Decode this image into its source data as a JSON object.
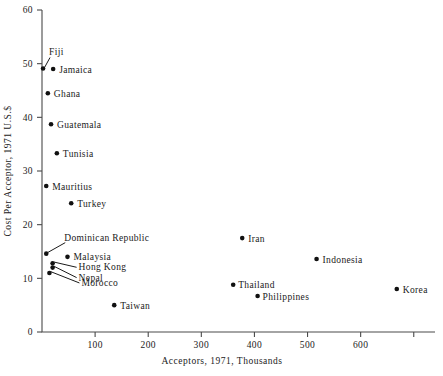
{
  "chart_data": {
    "type": "scatter",
    "title": "",
    "xlabel": "Acceptors, 1971, Thousands",
    "ylabel": "Cost Per Acceptor, 1971 U.S.$",
    "xlim": [
      0,
      740
    ],
    "ylim": [
      0,
      60
    ],
    "grid": false,
    "legend": "none",
    "xticks": [
      {
        "value": 100,
        "label": "100"
      },
      {
        "value": 200,
        "label": "200"
      },
      {
        "value": 300,
        "label": "300"
      },
      {
        "value": 400,
        "label": "400"
      },
      {
        "value": 500,
        "label": "500"
      },
      {
        "value": 600,
        "label": "600"
      },
      {
        "value": 700,
        "label": ""
      }
    ],
    "yticks": [
      {
        "value": 0,
        "label": "0"
      },
      {
        "value": 10,
        "label": "10"
      },
      {
        "value": 20,
        "label": "20"
      },
      {
        "value": 30,
        "label": "30"
      },
      {
        "value": 40,
        "label": "40"
      },
      {
        "value": 50,
        "label": "50"
      },
      {
        "value": 60,
        "label": "60"
      }
    ],
    "points": [
      {
        "name": "Fiji",
        "x": 2,
        "y": 49.1,
        "label": "Fiji",
        "label_dx": 6,
        "label_dy": -13,
        "anchor": "start",
        "leader": true
      },
      {
        "name": "Jamaica",
        "x": 21,
        "y": 49.0,
        "label": "Jamaica",
        "label_dx": 6,
        "label_dy": 3.5,
        "anchor": "start",
        "leader": false
      },
      {
        "name": "Ghana",
        "x": 11,
        "y": 44.5,
        "label": "Ghana",
        "label_dx": 6,
        "label_dy": 3.5,
        "anchor": "start",
        "leader": false
      },
      {
        "name": "Guatemala",
        "x": 17,
        "y": 38.7,
        "label": "Guatemala",
        "label_dx": 6,
        "label_dy": 3.5,
        "anchor": "start",
        "leader": false
      },
      {
        "name": "Tunisia",
        "x": 28,
        "y": 33.3,
        "label": "Tunisia",
        "label_dx": 6,
        "label_dy": 3.5,
        "anchor": "start",
        "leader": false
      },
      {
        "name": "Mauritius",
        "x": 8,
        "y": 27.2,
        "label": "Mauritius",
        "label_dx": 6,
        "label_dy": 3.5,
        "anchor": "start",
        "leader": false
      },
      {
        "name": "Turkey",
        "x": 55,
        "y": 24.0,
        "label": "Turkey",
        "label_dx": 6,
        "label_dy": 3.5,
        "anchor": "start",
        "leader": false
      },
      {
        "name": "Dominican Republic",
        "x": 8,
        "y": 14.6,
        "label": "Dominican Republic",
        "label_dx": 18,
        "label_dy": -13,
        "anchor": "start",
        "leader": true
      },
      {
        "name": "Malaysia",
        "x": 48,
        "y": 14.0,
        "label": "Malaysia",
        "label_dx": 6,
        "label_dy": 3.5,
        "anchor": "start",
        "leader": false
      },
      {
        "name": "Hong Kong",
        "x": 20,
        "y": 12.8,
        "label": "Hong Kong",
        "label_dx": 26,
        "label_dy": 7,
        "anchor": "start",
        "leader": true
      },
      {
        "name": "Nepal",
        "x": 20,
        "y": 12.0,
        "label": "Nepal",
        "label_dx": 26,
        "label_dy": 13,
        "anchor": "start",
        "leader": true
      },
      {
        "name": "Morocco",
        "x": 14,
        "y": 11.0,
        "label": "Morocco",
        "label_dx": 32,
        "label_dy": 13,
        "anchor": "start",
        "leader": true
      },
      {
        "name": "Taiwan",
        "x": 136,
        "y": 5.0,
        "label": "Taiwan",
        "label_dx": 6,
        "label_dy": 3.5,
        "anchor": "start",
        "leader": false
      },
      {
        "name": "Iran",
        "x": 377,
        "y": 17.5,
        "label": "Iran",
        "label_dx": 6,
        "label_dy": 3.5,
        "anchor": "start",
        "leader": false
      },
      {
        "name": "Indonesia",
        "x": 517,
        "y": 13.6,
        "label": "Indonesia",
        "label_dx": 6,
        "label_dy": 3.5,
        "anchor": "start",
        "leader": false
      },
      {
        "name": "Thailand",
        "x": 360,
        "y": 8.8,
        "label": "Thailand",
        "label_dx": 5,
        "label_dy": 3.5,
        "anchor": "start",
        "leader": false
      },
      {
        "name": "Philippines",
        "x": 406,
        "y": 6.7,
        "label": "Philippines",
        "label_dx": 5,
        "label_dy": 3.5,
        "anchor": "start",
        "leader": false
      },
      {
        "name": "Korea",
        "x": 668,
        "y": 8.0,
        "label": "Korea",
        "label_dx": 6,
        "label_dy": 3.5,
        "anchor": "start",
        "leader": false
      }
    ],
    "colors": {
      "marker": "#111111",
      "axis": "#4a4a4a",
      "text": "#1a1a1a",
      "background": "#ffffff"
    }
  }
}
